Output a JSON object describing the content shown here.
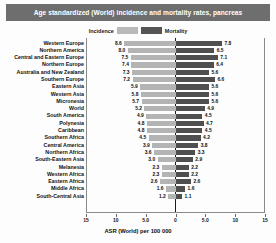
{
  "title": "Age standardized (World) incidence and mortality rates, pancreas",
  "legend": {
    "incidence_label": "Incidence",
    "mortality_label": "Mortality",
    "incidence_color": "#b4b4b4",
    "mortality_color": "#4f4f4f"
  },
  "colors": {
    "title_bar": "#6e6e6e",
    "title_text": "#ffffff",
    "axis": "#1b1b1b",
    "frame": "#8a8a8a",
    "background": "#fdfdfd"
  },
  "chart_data": {
    "type": "bar",
    "subtype": "diverging-horizontal-bar",
    "title": "Age standardized (World) incidence and mortality rates, pancreas",
    "xlabel": "ASR (World) per 100 000",
    "ylabel": "",
    "grid": false,
    "legend_position": "top-center",
    "xlim": [
      -15,
      15
    ],
    "xticks": [
      -15,
      -10,
      -5,
      0,
      5,
      10,
      15
    ],
    "xtick_labels": [
      "15",
      "10",
      "5.0",
      "0",
      "5.0",
      "10",
      "15"
    ],
    "left_direction": "incidence",
    "right_direction": "mortality",
    "categories": [
      "Western Europe",
      "Northern America",
      "Central and Eastern Europe",
      "Northern Europe",
      "Australia and New Zealand",
      "Southern Europe",
      "Eastern Asia",
      "Western Asia",
      "Micronesia",
      "World",
      "South America",
      "Polynesia",
      "Caribbean",
      "Southern Africa",
      "Central America",
      "Northern Africa",
      "South-Eastern Asia",
      "Melanesia",
      "Western Africa",
      "Eastern Africa",
      "Middle Africa",
      "South-Central Asia"
    ],
    "series": [
      {
        "name": "Incidence",
        "color": "#b4b4b4",
        "values": [
          8.6,
          8.0,
          7.5,
          7.4,
          7.3,
          7.2,
          5.9,
          5.8,
          5.7,
          5.2,
          4.9,
          4.8,
          4.8,
          4.5,
          3.9,
          3.6,
          3.0,
          2.3,
          2.3,
          2.6,
          1.6,
          1.2
        ]
      },
      {
        "name": "Mortality",
        "color": "#4f4f4f",
        "values": [
          7.8,
          6.5,
          7.1,
          6.4,
          5.6,
          6.6,
          5.6,
          5.6,
          5.6,
          4.9,
          4.5,
          4.7,
          4.5,
          4.2,
          3.8,
          3.3,
          2.9,
          2.2,
          2.2,
          2.6,
          1.6,
          1.1
        ]
      }
    ]
  }
}
